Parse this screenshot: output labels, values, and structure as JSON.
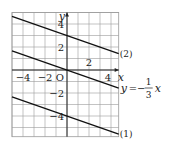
{
  "chart_data": {
    "type": "line",
    "title": "",
    "xlabel": "x",
    "ylabel": "y",
    "origin_label": "O",
    "xlim": [
      -5,
      4.7
    ],
    "ylim": [
      -5.8,
      5
    ],
    "grid": true,
    "x_tick_labels": [
      {
        "value": -4,
        "text": "−4"
      },
      {
        "value": -2,
        "text": "−2"
      },
      {
        "value": 2,
        "text": "2"
      },
      {
        "value": 4,
        "text": "4"
      }
    ],
    "y_tick_labels": [
      {
        "value": 4,
        "text": "4"
      },
      {
        "value": 2,
        "text": "2"
      },
      {
        "value": -2,
        "text": "−2"
      },
      {
        "value": -4,
        "text": "−4"
      }
    ],
    "series": [
      {
        "name": "(2)",
        "slope": -0.3333,
        "intercept": 3,
        "label": "(2)"
      },
      {
        "name": "y = -1/3 x",
        "slope": -0.3333,
        "intercept": 0,
        "label": "y=−",
        "fraction": {
          "num": "1",
          "den": "3"
        },
        "var": "x"
      },
      {
        "name": "(1)",
        "slope": -0.3333,
        "intercept": -4,
        "label": "(1)"
      }
    ]
  },
  "style": {
    "line_color": "#111111",
    "grid_color": "#9a9a9a",
    "axis_color": "#222222"
  }
}
